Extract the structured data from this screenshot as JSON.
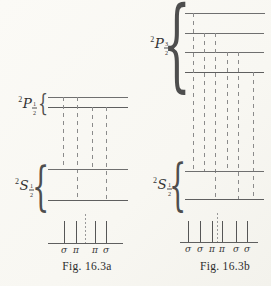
{
  "glyphs": {
    "brace": "{"
  },
  "colors": {
    "background": "#faf9f5",
    "level_line": "#6f6f6f",
    "transition_dash": "#8b8b8b",
    "spectral_line": "#565656",
    "text": "#323232"
  },
  "figure_a": {
    "caption": "Fig. 16.3a",
    "upper_term": {
      "sup": "2",
      "letter": "P",
      "frac_num": "1",
      "frac_den": "2"
    },
    "lower_term": {
      "sup": "2",
      "letter": "S",
      "frac_num": "1",
      "frac_den": "2"
    },
    "upper_sublevel_count": 2,
    "lower_sublevel_count": 2,
    "transition_count": 4,
    "spectrum_labels": [
      "σ",
      "π",
      "π",
      "σ"
    ]
  },
  "figure_b": {
    "caption": "Fig. 16.3b",
    "upper_term": {
      "sup": "2",
      "letter": "P",
      "frac_num": "3",
      "frac_den": "2"
    },
    "lower_term": {
      "sup": "2",
      "letter": "S",
      "frac_num": "1",
      "frac_den": "2"
    },
    "upper_sublevel_count": 4,
    "lower_sublevel_count": 2,
    "transition_count": 6,
    "spectrum_labels": [
      "σ",
      "σ",
      "π",
      "π",
      "σ",
      "σ"
    ]
  }
}
